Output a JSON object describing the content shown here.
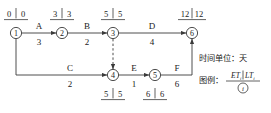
{
  "diagram": {
    "type": "activity-on-arrow network (CPM)",
    "time_unit_note": "时间单位：天",
    "legend_label": "图例：",
    "legend_numerator_left": "ET",
    "legend_numerator_left_sub": "i",
    "legend_numerator_right": "LT",
    "legend_numerator_right_sub": "i",
    "legend_denominator": "i",
    "nodes": [
      {
        "id": "1",
        "label": "1",
        "et": "0",
        "lt": "0",
        "et_lt": "0 | 0",
        "x": 16,
        "y": 33,
        "value_pos": "above"
      },
      {
        "id": "2",
        "label": "2",
        "et": "3",
        "lt": "3",
        "et_lt": "3 | 3",
        "x": 62,
        "y": 33,
        "value_pos": "above"
      },
      {
        "id": "3",
        "label": "3",
        "et": "5",
        "lt": "5",
        "et_lt": "5 | 5",
        "x": 113,
        "y": 33,
        "value_pos": "above"
      },
      {
        "id": "4",
        "label": "4",
        "et": "5",
        "lt": "5",
        "et_lt": "5 | 5",
        "x": 113,
        "y": 75,
        "value_pos": "below"
      },
      {
        "id": "5",
        "label": "5",
        "et": "6",
        "lt": "6",
        "et_lt": "6 | 6",
        "x": 155,
        "y": 75,
        "value_pos": "below"
      },
      {
        "id": "6",
        "label": "6",
        "et": "12",
        "lt": "12",
        "et_lt": "12 | 12",
        "x": 192,
        "y": 33,
        "value_pos": "above"
      }
    ],
    "activities": [
      {
        "name": "A",
        "duration": "3",
        "from": "1",
        "to": "2",
        "style": "solid"
      },
      {
        "name": "B",
        "duration": "2",
        "from": "2",
        "to": "3",
        "style": "solid"
      },
      {
        "name": "D",
        "duration": "4",
        "from": "3",
        "to": "6",
        "style": "solid"
      },
      {
        "name": "C",
        "duration": "2",
        "from": "1",
        "to": "4",
        "style": "solid"
      },
      {
        "name": "E",
        "duration": "1",
        "from": "4",
        "to": "5",
        "style": "solid"
      },
      {
        "name": "F",
        "duration": "6",
        "from": "5",
        "to": "6",
        "style": "solid"
      },
      {
        "name": "",
        "duration": "",
        "from": "3",
        "to": "4",
        "style": "dashed"
      }
    ],
    "colors": {
      "line": "#3a3a3a",
      "text": "#1a1a1a",
      "background": "#ffffff"
    }
  }
}
